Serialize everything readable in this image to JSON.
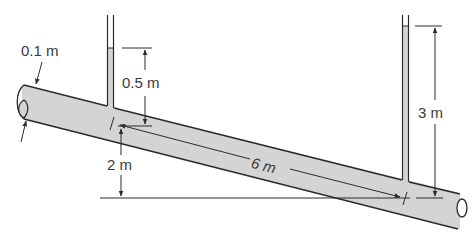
{
  "figure": {
    "colors": {
      "fluid_fill": "#d4d4d4",
      "outline": "#2a2a2a",
      "text": "#3a3a3a",
      "background": "#ffffff"
    }
  },
  "labels": {
    "pipe_diameter": "0.1 m",
    "left_piezometer_height": "0.5 m",
    "left_elevation": "2 m",
    "pipe_length": "6 m",
    "right_piezometer_height": "3 m"
  }
}
